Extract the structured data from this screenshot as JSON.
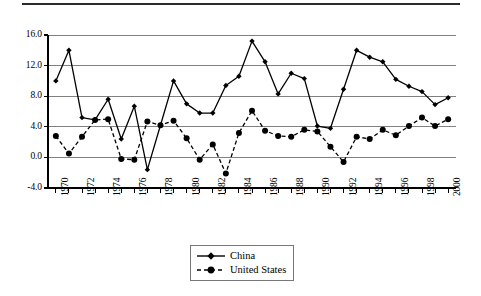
{
  "chart_data": {
    "type": "line",
    "title": "",
    "subtitle": "",
    "xlabel": "",
    "ylabel": "",
    "grid": true,
    "legend_position": "bottom-center",
    "x": [
      1970,
      1971,
      1972,
      1973,
      1974,
      1975,
      1976,
      1977,
      1978,
      1979,
      1980,
      1981,
      1982,
      1983,
      1984,
      1985,
      1986,
      1987,
      1988,
      1989,
      1990,
      1991,
      1992,
      1993,
      1994,
      1995,
      1996,
      1997,
      1998,
      1999,
      2000
    ],
    "xlim": [
      1969.4,
      2000.6
    ],
    "ylim": [
      -4.0,
      16.0
    ],
    "yticks": [
      -4.0,
      0.0,
      4.0,
      8.0,
      12.0,
      16.0
    ],
    "ytick_labels": [
      "-4.0",
      "0.0",
      "4.0",
      "8.0",
      "12.0",
      "16.0"
    ],
    "xtick_labels": [
      "1970",
      "1972",
      "1974",
      "1976",
      "1978",
      "1980",
      "1982",
      "1984",
      "1986",
      "1988",
      "1990",
      "1992",
      "1994",
      "1996",
      "1998",
      "2000"
    ],
    "xticks_minor_every": 1,
    "series": [
      {
        "name": "China",
        "marker": "diamond",
        "linestyle": "solid",
        "color": "#000000",
        "values": [
          10.0,
          14.0,
          5.2,
          4.9,
          7.6,
          2.4,
          6.7,
          -1.6,
          4.2,
          10.0,
          7.0,
          5.8,
          5.8,
          9.4,
          10.6,
          15.2,
          12.5,
          8.3,
          11.0,
          10.3,
          4.1,
          3.8,
          8.9,
          14.0,
          13.1,
          12.5,
          10.2,
          9.3,
          8.6,
          6.9,
          7.8
        ]
      },
      {
        "name": "United States",
        "marker": "circle",
        "linestyle": "dashed",
        "color": "#000000",
        "values": [
          2.8,
          0.5,
          2.7,
          4.9,
          5.0,
          -0.2,
          -0.3,
          4.7,
          4.2,
          4.8,
          2.5,
          -0.3,
          1.7,
          -2.1,
          3.2,
          6.1,
          3.5,
          2.8,
          2.7,
          3.6,
          3.4,
          1.4,
          -0.6,
          2.7,
          2.4,
          3.6,
          2.9,
          4.1,
          5.2,
          4.1,
          5.0
        ]
      }
    ]
  },
  "legend": {
    "items": [
      {
        "label": "China"
      },
      {
        "label": "United States"
      }
    ]
  },
  "colors": {
    "axis": "#000000",
    "grid": "#808080",
    "series": "#000000",
    "rule": "#2a2a2a"
  }
}
